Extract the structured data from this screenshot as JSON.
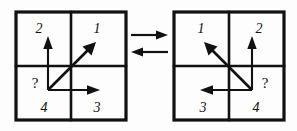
{
  "figure": {
    "title": "",
    "background_color": "#fdfdfd",
    "ink_color": "#111111",
    "panels": [
      {
        "id": "left-panel",
        "name": "left-quadrant-frame",
        "quadrant_labels": {
          "top_left": "2",
          "top_right": "1",
          "bottom_left": "4",
          "bottom_right": "3"
        },
        "question_mark": "?",
        "origin_quadrant": "bottom_left",
        "vectors": [
          {
            "name": "vertical-axis-arrow",
            "direction": "up"
          },
          {
            "name": "horizontal-axis-arrow",
            "direction": "right"
          },
          {
            "name": "diagonal-resultant-arrow",
            "direction": "up-right"
          }
        ]
      },
      {
        "id": "right-panel",
        "name": "right-quadrant-frame",
        "quadrant_labels": {
          "top_left": "1",
          "top_right": "2",
          "bottom_left": "3",
          "bottom_right": "4"
        },
        "question_mark": "?",
        "origin_quadrant": "bottom_right",
        "vectors": [
          {
            "name": "vertical-axis-arrow",
            "direction": "up"
          },
          {
            "name": "horizontal-axis-arrow",
            "direction": "left"
          },
          {
            "name": "diagonal-resultant-arrow",
            "direction": "up-left"
          }
        ]
      }
    ],
    "connector": {
      "name": "bidirectional-equivalence-arrows",
      "top_arrow_direction": "right",
      "bottom_arrow_direction": "left",
      "label": ""
    }
  }
}
